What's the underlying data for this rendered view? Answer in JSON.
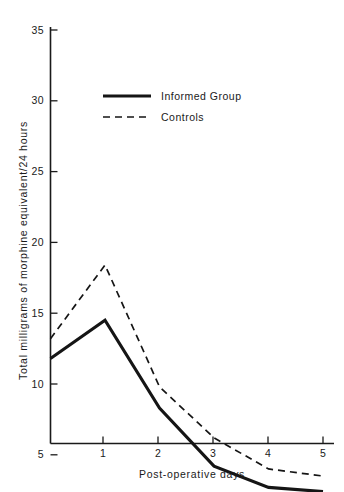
{
  "chart_data": {
    "type": "line",
    "title": "",
    "xlabel": "Post-operative days",
    "ylabel": "Total milligrams of morphine equivalent/24 hours",
    "x": [
      0,
      1,
      2,
      3,
      4,
      5
    ],
    "xtick_labels": [
      "1",
      "2",
      "3",
      "4",
      "5"
    ],
    "xticks": [
      1,
      2,
      3,
      4,
      5
    ],
    "ytick_labels": [
      "5",
      "10",
      "15",
      "20",
      "25",
      "30",
      "35"
    ],
    "yticks": [
      5,
      10,
      15,
      20,
      25,
      30,
      35
    ],
    "xlim": [
      0,
      5
    ],
    "ylim": [
      0,
      37
    ],
    "grid": false,
    "legend_position": "upper-center-left",
    "series": [
      {
        "name": "Informed Group",
        "style": "solid",
        "values": [
          11.8,
          14.5,
          8.3,
          4.2,
          2.7,
          2.4
        ]
      },
      {
        "name": "Controls",
        "style": "dashed",
        "values": [
          13.2,
          18.4,
          9.8,
          6.2,
          4.0,
          3.5
        ]
      }
    ]
  },
  "legend": {
    "entries": [
      {
        "label": "Informed Group"
      },
      {
        "label": "Controls"
      }
    ]
  },
  "axes": {
    "x_title": "Post-operative days",
    "y_title": "Total milligrams of morphine equivalent/24 hours"
  },
  "colors": {
    "ink": "#151515",
    "background": "#ffffff"
  }
}
